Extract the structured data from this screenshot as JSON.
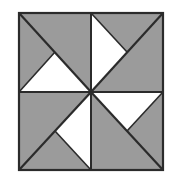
{
  "figure": {
    "canvas": {
      "width": 173,
      "height": 183
    },
    "background_color": "#ffffff"
  },
  "palette": {
    "shaded": "#9b9b9b",
    "unshaded": "#ffffff",
    "outline": "#2b2b2b",
    "background": "#ffffff"
  },
  "geometry": {
    "square": {
      "left": 19,
      "top": 13,
      "right": 163,
      "bottom": 170,
      "width": 144,
      "height": 157
    },
    "center": {
      "x": 91,
      "y": 92
    },
    "midline_x": 91,
    "midline_y": 92,
    "outline_width": 2.2,
    "divider_width": 2.0,
    "diagonal_width": 2.2
  },
  "pattern": {
    "name": "pinwheel",
    "symmetry": "4-fold rotational",
    "quadrant_count": 4,
    "white_triangles": 4,
    "description": "A square divided into four equal quadrants, each shaded gray and containing one white right triangle with its apex at the center of the square, arranged in rotational pinwheel symmetry."
  },
  "quadrants": [
    {
      "id": "top-left",
      "label": "Top left quadrant",
      "bounds": {
        "x0": 19,
        "y0": 13,
        "x1": 91,
        "y1": 92
      },
      "fill": "#9b9b9b",
      "white_triangle": {
        "position": "bottom half",
        "apex": "up at quadrant center",
        "points": "19,92 91,92 55,52"
      },
      "diagonal": "19,13 91,92"
    },
    {
      "id": "top-right",
      "label": "Top right quadrant",
      "bounds": {
        "x0": 91,
        "y0": 13,
        "x1": 163,
        "y1": 92
      },
      "fill": "#9b9b9b",
      "white_triangle": {
        "position": "left half",
        "apex": "right at quadrant center",
        "points": "91,13 91,92 127,52"
      },
      "diagonal": "163,13 91,92"
    },
    {
      "id": "bottom-left",
      "label": "Bottom left quadrant",
      "bounds": {
        "x0": 19,
        "y0": 92,
        "x1": 91,
        "y1": 170
      },
      "fill": "#9b9b9b",
      "white_triangle": {
        "position": "right half",
        "apex": "left at quadrant center",
        "points": "91,92 91,170 55,131"
      },
      "diagonal": "19,170 91,92"
    },
    {
      "id": "bottom-right",
      "label": "Bottom right quadrant",
      "bounds": {
        "x0": 91,
        "y0": 92,
        "x1": 163,
        "y1": 170
      },
      "fill": "#9b9b9b",
      "white_triangle": {
        "position": "top half",
        "apex": "down at quadrant center",
        "points": "91,92 163,92 127,131"
      },
      "diagonal": "163,170 91,92"
    }
  ]
}
